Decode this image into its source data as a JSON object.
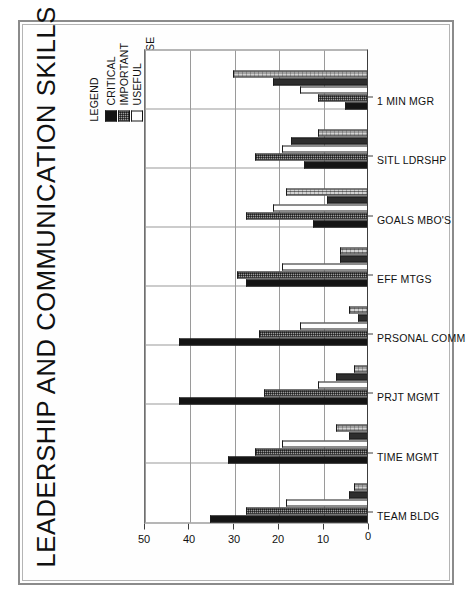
{
  "title": "LEADERSHIP AND COMMUNICATION SKILLS",
  "legend": {
    "heading": "LEGEND",
    "entries": [
      {
        "label": "CRITICAL",
        "color": "#141414",
        "pattern": "solid-black"
      },
      {
        "label": "IMPORTANT",
        "color": "#9d9d9d",
        "pattern": "dotted-grey"
      },
      {
        "label": "USEFUL",
        "color": "#fdfdfd",
        "pattern": "white"
      },
      {
        "label": "FUTURE USE",
        "color": "#2e2e2e",
        "pattern": "dark-grey"
      },
      {
        "label": "NONE",
        "color": "#d3d3d3",
        "pattern": "fine-grid"
      }
    ]
  },
  "chart_data": {
    "type": "bar",
    "title": "LEADERSHIP AND COMMUNICATION SKILLS",
    "orientation": "vertical-grouped",
    "rotated_90_ccw": true,
    "xlabel": "",
    "ylabel": "",
    "ylim": [
      0,
      50
    ],
    "yticks": [
      0,
      10,
      20,
      30,
      40,
      50
    ],
    "grid": true,
    "legend_position": "top-right",
    "categories": [
      "TEAM BLDG",
      "TIME MGMT",
      "PRJT MGMT",
      "PRSONAL COMM",
      "EFF MTGS",
      "GOALS MBO'S",
      "SITL LDRSHP",
      "1 MIN MGR"
    ],
    "series": [
      {
        "name": "CRITICAL",
        "values": [
          35,
          31,
          42,
          42,
          27,
          12,
          14,
          5
        ]
      },
      {
        "name": "IMPORTANT",
        "values": [
          27,
          25,
          23,
          24,
          29,
          27,
          25,
          11
        ]
      },
      {
        "name": "USEFUL",
        "values": [
          18,
          19,
          11,
          15,
          19,
          21,
          19,
          15
        ]
      },
      {
        "name": "FUTURE USE",
        "values": [
          4,
          4,
          7,
          2,
          6,
          9,
          17,
          21
        ]
      },
      {
        "name": "NONE",
        "values": [
          3,
          7,
          3,
          4,
          6,
          18,
          11,
          30
        ]
      }
    ]
  }
}
